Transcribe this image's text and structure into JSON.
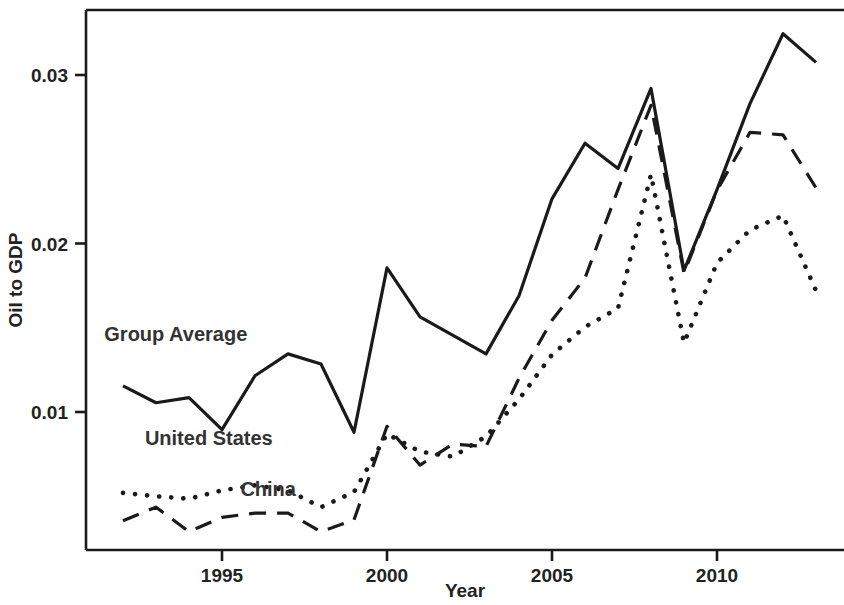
{
  "chart_data": {
    "type": "line",
    "title": "",
    "xlabel": "Year",
    "ylabel": "Oil to GDP",
    "xlim": [
      1992,
      2013
    ],
    "ylim": [
      0.0,
      0.0342
    ],
    "grid": false,
    "legend_position": "inline-annotations",
    "x": [
      1992,
      1993,
      1994,
      1995,
      1996,
      1997,
      1998,
      1999,
      2000,
      2001,
      2002,
      2003,
      2004,
      2005,
      2006,
      2007,
      2008,
      2009,
      2010,
      2011,
      2012,
      2013
    ],
    "xticks": [
      1995,
      2000,
      2005,
      2010
    ],
    "xticklabels": [
      "1995",
      "2000",
      "2005",
      "2010"
    ],
    "yticks": [
      0.01,
      0.02,
      0.03
    ],
    "yticklabels": [
      "0.01",
      "0.02",
      "0.03"
    ],
    "series": [
      {
        "name": "Group Average",
        "style": "solid",
        "color": "#1a1a1a",
        "label_x": 1993.6,
        "label_y": 0.0142,
        "values": [
          0.01155,
          0.01055,
          0.01085,
          0.00895,
          0.01215,
          0.01345,
          0.01285,
          0.0088,
          0.01855,
          0.01565,
          0.01455,
          0.01345,
          0.0169,
          0.02265,
          0.02595,
          0.02445,
          0.0292,
          0.0184,
          0.0232,
          0.0283,
          0.03245,
          0.03075
        ]
      },
      {
        "name": "United States",
        "style": "dotted",
        "color": "#1a1a1a",
        "label_x": 1994.6,
        "label_y": 0.00805,
        "values": [
          0.0052,
          0.005,
          0.00485,
          0.00535,
          0.00565,
          0.00535,
          0.00435,
          0.00525,
          0.0087,
          0.00765,
          0.00735,
          0.00855,
          0.01075,
          0.0134,
          0.01505,
          0.01615,
          0.0241,
          0.0141,
          0.01885,
          0.0208,
          0.02165,
          0.0172
        ]
      },
      {
        "name": "China",
        "style": "dashed",
        "color": "#1a1a1a",
        "label_x": 1996.4,
        "label_y": 0.005,
        "values": [
          0.00355,
          0.00435,
          0.0029,
          0.00375,
          0.004,
          0.004,
          0.0029,
          0.0036,
          0.00915,
          0.00685,
          0.0081,
          0.00795,
          0.012,
          0.01545,
          0.01795,
          0.0232,
          0.0282,
          0.01825,
          0.02315,
          0.0266,
          0.02645,
          0.0233
        ]
      }
    ]
  },
  "axes": {
    "x_title": "Year",
    "y_title": "Oil to GDP"
  }
}
